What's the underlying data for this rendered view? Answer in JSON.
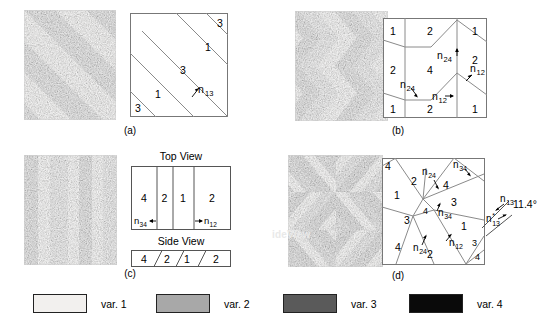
{
  "figure": {
    "type": "scientific-figure"
  },
  "legend": {
    "items": [
      {
        "label": "var. 1",
        "color": "#f2f0ee",
        "name": "variant-1"
      },
      {
        "label": "var. 2",
        "color": "#a8a8a8",
        "name": "variant-2"
      },
      {
        "label": "var. 3",
        "color": "#5a5a5a",
        "name": "variant-3"
      },
      {
        "label": "var. 4",
        "color": "#0a0a0a",
        "name": "variant-4"
      }
    ]
  },
  "panels": [
    {
      "id": "a",
      "caption": "(a)",
      "micrograph": {
        "name": "micrograph-a",
        "pattern": "diagonal-stripes",
        "variants": [
          "1",
          "3"
        ],
        "stripe_angle_deg": 45
      },
      "schematic": {
        "name": "schematic-a",
        "region_labels": [
          "3",
          "1",
          "3",
          "1",
          "3"
        ],
        "annotations": [
          {
            "text": "n",
            "sub": "13",
            "sup": ""
          }
        ]
      }
    },
    {
      "id": "b",
      "caption": "(b)",
      "micrograph": {
        "name": "micrograph-b",
        "pattern": "chevron",
        "variants": [
          "1",
          "2",
          "4"
        ]
      },
      "schematic": {
        "name": "schematic-b",
        "region_labels": [
          "1",
          "2",
          "1",
          "2",
          "4",
          "2",
          "1",
          "2",
          "1"
        ],
        "annotations": [
          {
            "text": "n",
            "sub": "24",
            "sup": ""
          },
          {
            "text": "n",
            "sub": "12",
            "sup": ""
          },
          {
            "text": "n",
            "sub": "24",
            "sup": ""
          },
          {
            "text": "n",
            "sub": "12",
            "sup": ""
          }
        ]
      }
    },
    {
      "id": "c",
      "caption": "(c)",
      "micrograph": {
        "name": "micrograph-c",
        "pattern": "vertical-stripes",
        "variants": [
          "4",
          "1",
          "2",
          "4",
          "1",
          "2"
        ]
      },
      "schematic": {
        "name": "schematic-c",
        "top_view_title": "Top View",
        "side_view_title": "Side View",
        "top_view_labels": [
          "4",
          "2",
          "1",
          "2"
        ],
        "side_view_labels": [
          "4",
          "2",
          "1",
          "2"
        ],
        "annotations": [
          {
            "text": "n",
            "sub": "34",
            "sup": ""
          },
          {
            "text": "n",
            "sub": "12",
            "sup": ""
          }
        ]
      }
    },
    {
      "id": "d",
      "caption": "(d)",
      "micrograph": {
        "name": "micrograph-d",
        "pattern": "zigzag-crossed",
        "variants": [
          "1",
          "2",
          "3",
          "4"
        ],
        "overlay_text": "ideView"
      },
      "schematic": {
        "name": "schematic-d",
        "region_labels": [
          "4",
          "2",
          "4",
          "1",
          "3",
          "3",
          "4",
          "1",
          "4",
          "2",
          "3",
          "4"
        ],
        "angle_label": "11.4°",
        "annotations": [
          {
            "text": "n",
            "sub": "24",
            "sup": ""
          },
          {
            "text": "n",
            "sub": "34",
            "sup": ""
          },
          {
            "text": "n",
            "sub": "34",
            "sup": ""
          },
          {
            "text": "n",
            "sub": "24",
            "sup": ""
          },
          {
            "text": "n",
            "sub": "12",
            "sup": ""
          },
          {
            "text": "n",
            "sub": "13",
            "sup": ""
          },
          {
            "text": "n",
            "sub": "13",
            "sup": "*"
          }
        ]
      }
    }
  ]
}
